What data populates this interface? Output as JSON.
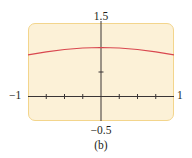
{
  "caption": "(b)",
  "colors": {
    "frame_fill": "#fcf1d7",
    "frame_border": "#f3d58c",
    "axis": "#3a3535",
    "curve": "#d9474f"
  },
  "chart_data": {
    "type": "line",
    "title": "",
    "caption": "(b)",
    "xlabel": "",
    "ylabel": "",
    "xlim": [
      -1,
      1
    ],
    "ylim": [
      -0.5,
      1.5
    ],
    "axis_labels": {
      "x_min": "−1",
      "x_max": "1",
      "y_min": "−0.5",
      "y_max": "1.5"
    },
    "x_ticks": [
      -0.75,
      -0.5,
      -0.25,
      0.25,
      0.5,
      0.75
    ],
    "y_ticks": [
      0.5,
      1
    ],
    "grid": false,
    "legend": null,
    "series": [
      {
        "name": "curve",
        "color": "#d9474f",
        "x": [
          -1,
          -0.75,
          -0.5,
          -0.25,
          0,
          0.25,
          0.5,
          0.75,
          1
        ],
        "y": [
          0.85,
          0.91,
          0.96,
          0.99,
          1.0,
          0.99,
          0.96,
          0.91,
          0.85
        ]
      }
    ]
  }
}
